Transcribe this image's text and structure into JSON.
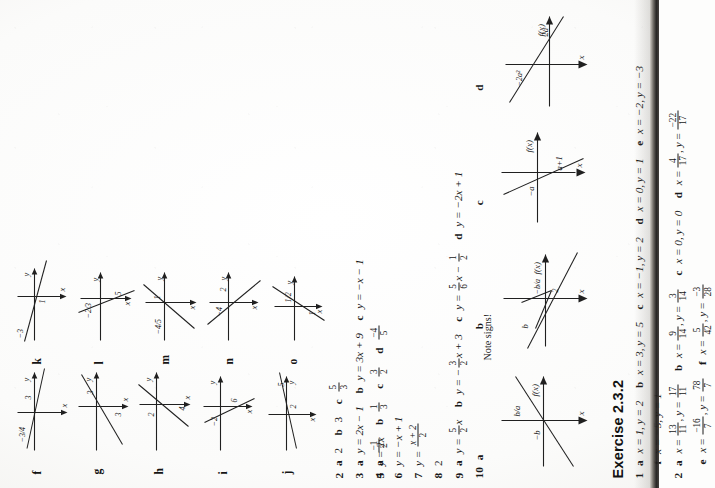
{
  "document": {
    "type": "scanned-textbook-answer-page",
    "orientation": "rotated-90-counterclockwise",
    "page_background": "#fdfdfc",
    "ink_color": "#171717"
  },
  "right_column": {
    "graphs": [
      {
        "id": "f",
        "label": "f",
        "x_intercept": "-3/4",
        "y_intercept": "3",
        "axis_labels": {
          "vertical": "y",
          "horizontal": "x"
        }
      },
      {
        "id": "g",
        "label": "g",
        "x_intercept": "3",
        "y_intercept": "3",
        "axis_labels": {
          "vertical": "y",
          "horizontal": "x"
        }
      },
      {
        "id": "h",
        "label": "h",
        "x_intercept": "2",
        "y_intercept": "4",
        "axis_labels": {
          "vertical": "y",
          "horizontal": "x"
        }
      },
      {
        "id": "i",
        "label": "i",
        "x_intercept": "-2",
        "y_intercept": "6",
        "axis_labels": {
          "vertical": "y",
          "horizontal": "x"
        }
      },
      {
        "id": "j",
        "label": "j",
        "x_intercept": "5",
        "y_intercept": "2",
        "axis_labels": {
          "vertical": "y",
          "horizontal": "x"
        }
      },
      {
        "id": "k",
        "label": "k",
        "x_intercept": "-3",
        "y_intercept": "1",
        "axis_labels": {
          "vertical": "y",
          "horizontal": "x"
        }
      },
      {
        "id": "l",
        "label": "l",
        "x_intercept": "-2/3",
        "y_intercept": "5",
        "axis_labels": {
          "vertical": "y",
          "horizontal": "x"
        }
      },
      {
        "id": "m",
        "label": "m",
        "x_intercept": "-4/5",
        "y_intercept": "1",
        "axis_labels": {
          "vertical": "y",
          "horizontal": "x"
        }
      },
      {
        "id": "n",
        "label": "n",
        "x_intercept": "2",
        "y_intercept": "-4",
        "axis_labels": {
          "vertical": "y",
          "horizontal": "x"
        }
      },
      {
        "id": "o",
        "label": "o",
        "x_intercept": "1/2",
        "y_intercept": "1",
        "axis_labels": {
          "vertical": "y",
          "horizontal": "x"
        }
      }
    ],
    "answers": [
      {
        "number": "2",
        "parts": [
          {
            "letter": "a",
            "value": "2"
          },
          {
            "letter": "b",
            "value": "3"
          },
          {
            "letter": "c",
            "fraction": {
              "num": "5",
              "den": "3"
            }
          }
        ]
      },
      {
        "number": "3",
        "parts": [
          {
            "letter": "a",
            "value": "y = 2x − 1"
          },
          {
            "letter": "b",
            "value": "y = 3x + 9"
          },
          {
            "letter": "c",
            "value": "y = −x − 1"
          }
        ]
      },
      {
        "number": "4",
        "parts": [
          {
            "letter": "a",
            "fraction": {
              "num": "−1",
              "den": "2"
            }
          },
          {
            "letter": "b",
            "fraction": {
              "num": "1",
              "den": "3"
            }
          },
          {
            "letter": "c",
            "fraction": {
              "num": "3",
              "den": "2"
            }
          },
          {
            "letter": "d",
            "fraction": {
              "num": "−4",
              "den": "5"
            }
          }
        ]
      }
    ]
  },
  "left_column": {
    "answers": [
      {
        "number": "5",
        "value": "y = 2x"
      },
      {
        "number": "6",
        "value": "y = −x + 1"
      },
      {
        "number": "7",
        "value_prefix": "y = ",
        "fraction": {
          "num": "x + 2",
          "den": "2"
        }
      },
      {
        "number": "8",
        "value": "2"
      },
      {
        "number": "9",
        "parts": [
          {
            "letter": "a",
            "prefix": "y = ",
            "fraction": {
              "num": "5",
              "den": "2"
            },
            "suffix": "x"
          },
          {
            "letter": "b",
            "prefix": "y = −",
            "fraction": {
              "num": "3",
              "den": "2"
            },
            "suffix": "x + 3"
          },
          {
            "letter": "c",
            "prefix": "y = ",
            "fraction": {
              "num": "5",
              "den": "6"
            },
            "suffix": "x − ",
            "suffix_fraction": {
              "num": "1",
              "den": "2"
            }
          },
          {
            "letter": "d",
            "prefix": "y = −2x + 1"
          }
        ]
      },
      {
        "number": "10",
        "sublabels": [
          "a",
          "b",
          "c",
          "d"
        ]
      }
    ],
    "graph_note": "Note signs!",
    "graphs": [
      {
        "id": "10a",
        "label": "a",
        "fn_label": "f(x)",
        "axis_x": "x",
        "marks": [
          "b/a",
          "−b"
        ]
      },
      {
        "id": "10b",
        "label": "b",
        "fn_label": "f(x)",
        "axis_x": "x",
        "marks": [
          "−b/a",
          "b",
          "2"
        ]
      },
      {
        "id": "10c",
        "label": "c",
        "fn_label": "f(x)",
        "axis_x": "x",
        "marks": [
          "−a",
          "a+1"
        ]
      },
      {
        "id": "10d",
        "label": "d",
        "fn_label": "f(x)",
        "axis_x": "x",
        "marks": [
          "−2a²",
          "2a"
        ]
      }
    ]
  },
  "exercise": {
    "heading": "Exercise 2.3.2",
    "rows": [
      {
        "number": "1",
        "parts": [
          {
            "letter": "a",
            "value": "x = 1, y = 2"
          },
          {
            "letter": "b",
            "value": "x = 3, y = 5"
          },
          {
            "letter": "c",
            "value": "x = −1, y = 2"
          },
          {
            "letter": "d",
            "value": "x = 0, y = 1"
          },
          {
            "letter": "e",
            "value": "x = −2, y = −3"
          },
          {
            "letter": "f",
            "value": "x = −5, y = 1"
          }
        ]
      },
      {
        "number": "2",
        "parts": [
          {
            "letter": "a",
            "x": {
              "num": "13",
              "den": "11"
            },
            "y": {
              "num": "17",
              "den": "11"
            }
          },
          {
            "letter": "b",
            "x": {
              "num": "9",
              "den": "14"
            },
            "y": {
              "num": "3",
              "den": "14"
            }
          },
          {
            "letter": "c",
            "value": "x = 0, y = 0"
          },
          {
            "letter": "d",
            "x": {
              "num": "4",
              "den": "17"
            },
            "y": {
              "num": "−22",
              "den": "17"
            }
          },
          {
            "letter": "e",
            "x": {
              "num": "−16",
              "den": "7"
            },
            "y": {
              "num": "78",
              "den": "7"
            }
          },
          {
            "letter": "f",
            "x": {
              "num": "5",
              "den": "42"
            },
            "y": {
              "num": "−3",
              "den": "28"
            }
          }
        ]
      }
    ]
  }
}
